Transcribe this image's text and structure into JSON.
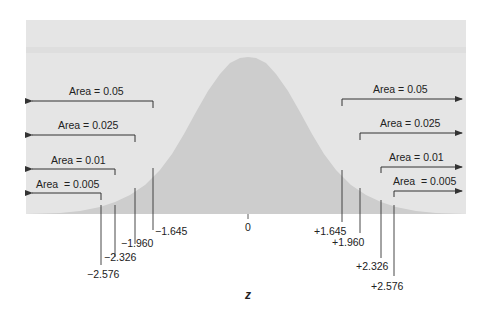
{
  "colors": {
    "panel": "#e5e5e5",
    "band": "#dcdcdc",
    "curve": "#cdcdcd",
    "line": "#333333",
    "text": "#222222"
  },
  "axis": {
    "variable": "z",
    "center_label": "0"
  },
  "left_tails": [
    {
      "label": "Area = 0.05",
      "area": 0.05,
      "critical": "−1.645"
    },
    {
      "label": "Area = 0.025",
      "area": 0.025,
      "critical": "−1.960"
    },
    {
      "label": "Area = 0.01",
      "area": 0.01,
      "critical": "−2.326"
    },
    {
      "label": "Area  = 0.005",
      "area": 0.005,
      "critical": "−2.576"
    }
  ],
  "right_tails": [
    {
      "label": "Area = 0.05",
      "area": 0.05,
      "critical": "+1.645"
    },
    {
      "label": "Area = 0.025",
      "area": 0.025,
      "critical": "+1.960"
    },
    {
      "label": "Area = 0.01",
      "area": 0.01,
      "critical": "+2.326"
    },
    {
      "label": "Area  = 0.005",
      "area": 0.005,
      "critical": "+2.576"
    }
  ]
}
